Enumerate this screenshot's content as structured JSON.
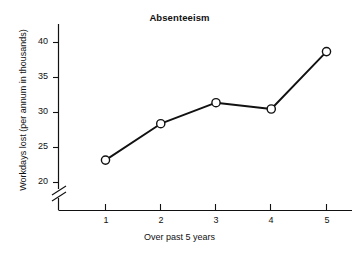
{
  "chart_data": {
    "type": "line",
    "title": "Absenteeism",
    "xlabel": "Over past 5 years",
    "ylabel": "Workdays lost (per annum in thousands)",
    "categories": [
      "1",
      "2",
      "3",
      "4",
      "5"
    ],
    "x": [
      1,
      2,
      3,
      4,
      5
    ],
    "values": [
      23.2,
      28.4,
      31.4,
      30.5,
      38.7
    ],
    "series": [
      {
        "name": "Workdays lost",
        "values": [
          23.2,
          28.4,
          31.4,
          30.5,
          38.7
        ]
      }
    ],
    "xlim": [
      0.45,
      5.45
    ],
    "ylim": [
      18.5,
      41.5
    ],
    "ytick_labels": [
      "20",
      "25",
      "30",
      "35",
      "40"
    ],
    "ytick_values": [
      20,
      25,
      30,
      35,
      40
    ],
    "xtick_labels": [
      "1",
      "2",
      "3",
      "4",
      "5"
    ],
    "xtick_values": [
      1,
      2,
      3,
      4,
      5
    ],
    "grid": false,
    "legend": false,
    "axis_break": {
      "axis": "y",
      "present": true,
      "note": "y-axis broken below 20"
    },
    "marker": "open-circle",
    "line_color": "#111111",
    "marker_fill": "#ffffff",
    "marker_stroke": "#111111",
    "axis_color": "#111111"
  }
}
